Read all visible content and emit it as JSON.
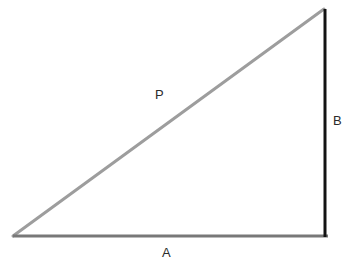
{
  "figure": {
    "type": "right-triangle-diagram",
    "background_color": "#ffffff",
    "width": 349,
    "height": 270
  },
  "vertices": {
    "left": {
      "x": 13,
      "y": 236
    },
    "bottom_right": {
      "x": 328,
      "y": 236
    },
    "top_right": {
      "x": 324,
      "y": 9
    }
  },
  "sides": {
    "base": {
      "label": "A",
      "color": "#787878",
      "stroke_width": 3,
      "x1": 13,
      "y1": 236,
      "x2": 328,
      "y2": 236
    },
    "vertical": {
      "label": "B",
      "color": "#131313",
      "stroke_width": 3,
      "x1": 325,
      "y1": 9,
      "x2": 325,
      "y2": 237
    },
    "hypotenuse": {
      "label": "P",
      "color": "#9d9d9d",
      "stroke_width": 3,
      "x1": 13,
      "y1": 236,
      "x2": 324,
      "y2": 9
    }
  },
  "labels": {
    "hypotenuse_label": "P",
    "vertical_label": "B",
    "base_label": "A",
    "text_color": "#2b2b2b",
    "font_size": "13px"
  }
}
